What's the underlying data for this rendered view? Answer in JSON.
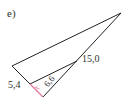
{
  "part_label": "e)",
  "labels": {
    "side_15": "15,0",
    "side_5_4": "5,4",
    "side_x": "x",
    "side_6_6": "6,6"
  },
  "colors": {
    "line": "#222222",
    "highlight": "#e07a9a"
  }
}
